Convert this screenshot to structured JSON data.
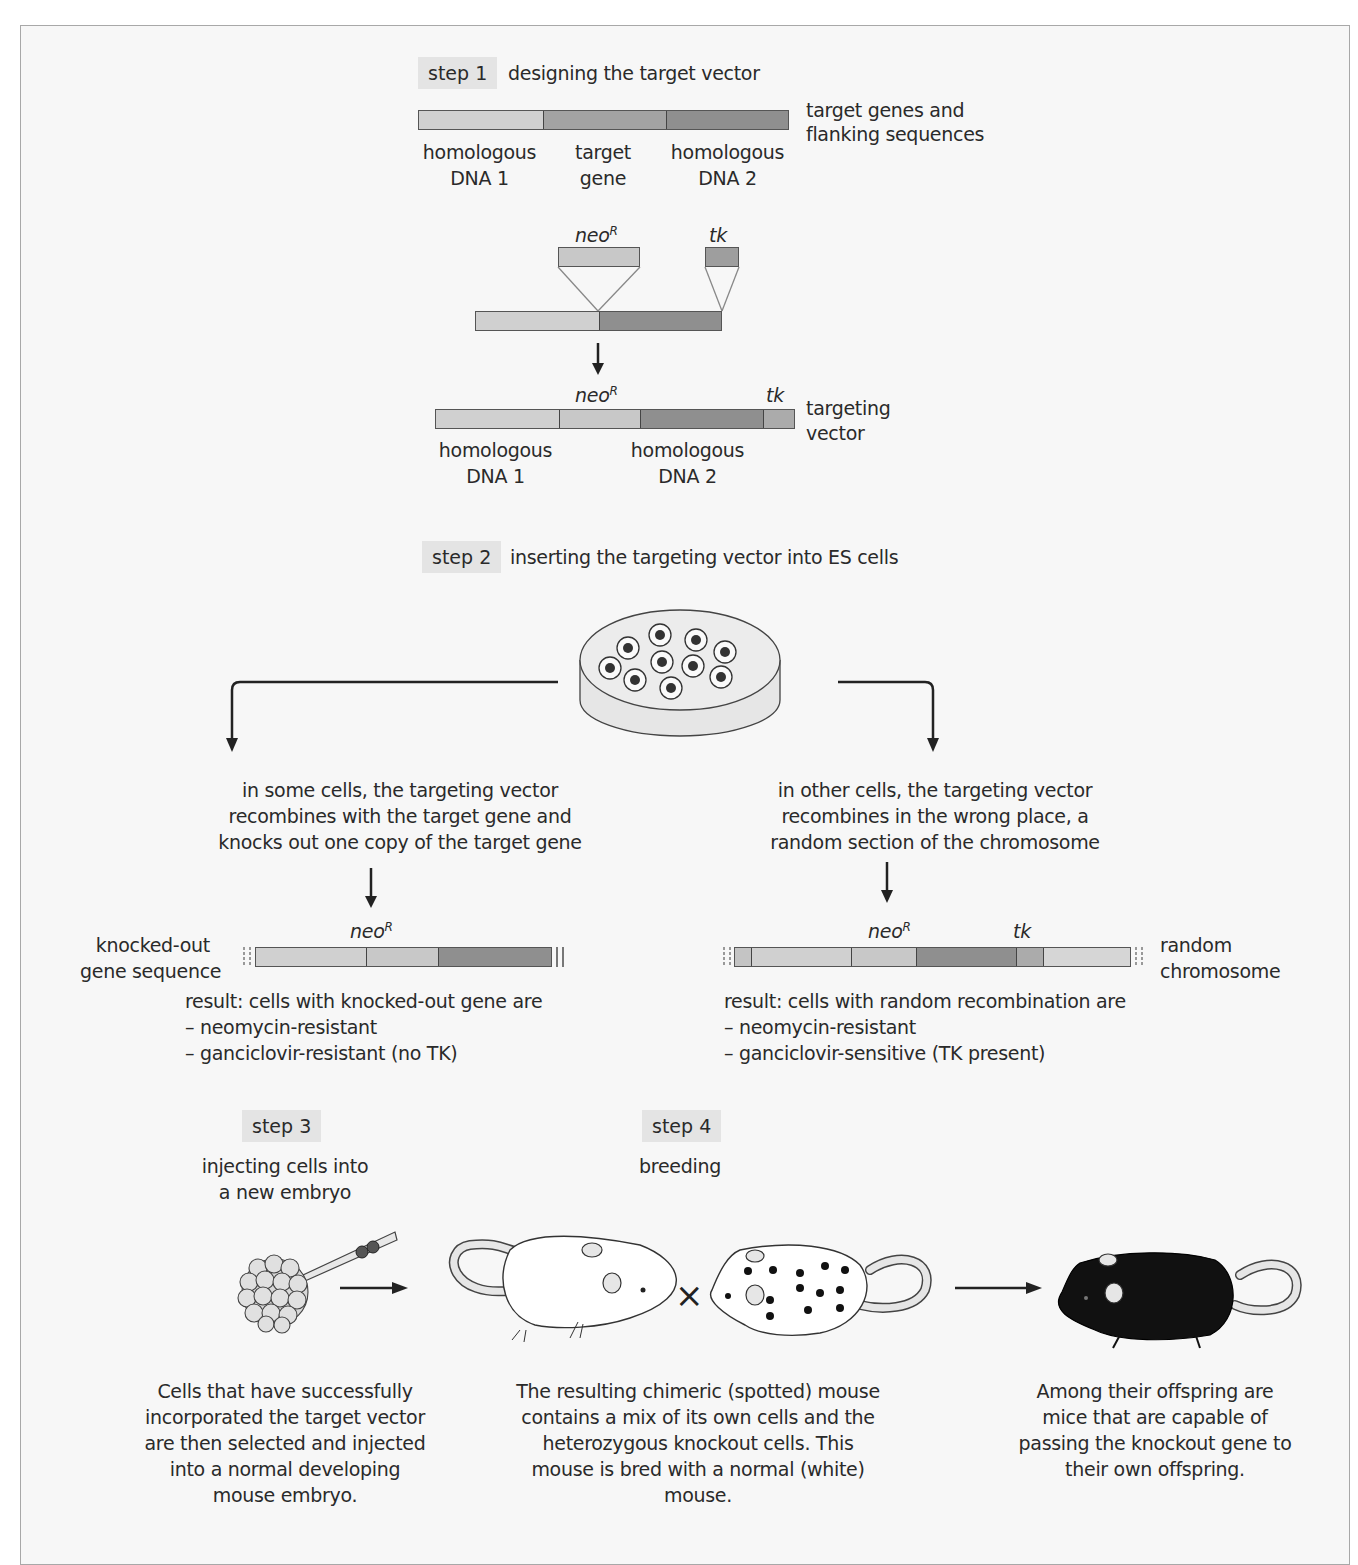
{
  "figure": {
    "colors": {
      "frame_border": "#a8a8a8",
      "frame_background": "#f7f7f7",
      "step_label_background": "#e4e4e4",
      "homologous_dna_1": "#d0d0d0",
      "target_gene": "#a3a3a3",
      "homologous_dna_2": "#8f8f8f",
      "neoR": "#c8c8c8",
      "tk": "#ababab",
      "knockout_mouse": "#111111"
    },
    "step1": {
      "label": "step 1",
      "title": "designing the target vector",
      "top_bar": {
        "segments": [
          "homologous DNA 1",
          "target gene",
          "homologous DNA 2"
        ],
        "label_line1": "target genes and",
        "label_line2": "flanking sequences"
      },
      "seg_labels": {
        "hom1_line1": "homologous",
        "hom1_line2": "DNA 1",
        "target_line1": "target",
        "target_line2": "gene",
        "hom2_line1": "homologous",
        "hom2_line2": "DNA 2"
      },
      "insert_labels": {
        "neo": "neo",
        "neo_sup": "R",
        "tk": "tk"
      },
      "targeting_vector": {
        "neo": "neo",
        "neo_sup": "R",
        "tk": "tk",
        "label_line1": "targeting",
        "label_line2": "vector",
        "hom1_line1": "homologous",
        "hom1_line2": "DNA 1",
        "hom2_line1": "homologous",
        "hom2_line2": "DNA 2"
      }
    },
    "step2": {
      "label": "step 2",
      "title": "inserting the targeting vector into ES cells",
      "dish_cell_count": 10,
      "left_branch": {
        "description_lines": [
          "in some cells, the targeting vector",
          "recombines with the target gene and",
          "knocks out one copy of the target gene"
        ],
        "seq_label_line1": "knocked-out",
        "seq_label_line2": "gene sequence",
        "neo": "neo",
        "neo_sup": "R",
        "result_lines": [
          "result: cells with knocked-out gene are",
          "– neomycin-resistant",
          "– ganciclovir-resistant (no TK)"
        ]
      },
      "right_branch": {
        "description_lines": [
          "in other cells, the targeting vector",
          "recombines in the wrong place, a",
          "random section of the chromosome"
        ],
        "seq_label_line1": "random",
        "seq_label_line2": "chromosome",
        "neo": "neo",
        "neo_sup": "R",
        "tk": "tk",
        "result_lines": [
          "result: cells with random recombination are",
          "– neomycin-resistant",
          "– ganciclovir-sensitive (TK present)"
        ]
      }
    },
    "step3": {
      "label": "step 3",
      "title_line1": "injecting cells into",
      "title_line2": "a new embryo",
      "caption_lines": [
        "Cells that have successfully",
        "incorporated the target vector",
        "are then selected and injected",
        "into a normal developing",
        "mouse embryo."
      ]
    },
    "step4": {
      "label": "step 4",
      "title": "breeding",
      "cross_symbol": "×",
      "chimeric_caption_lines": [
        "The resulting chimeric (spotted) mouse",
        "contains a mix of its own cells and the",
        "heterozygous knockout cells. This",
        "mouse is bred with a normal (white)",
        "mouse."
      ],
      "offspring_caption_lines": [
        "Among their offspring are",
        "mice that are capable of",
        "passing the knockout gene to",
        "their own offspring."
      ]
    }
  }
}
